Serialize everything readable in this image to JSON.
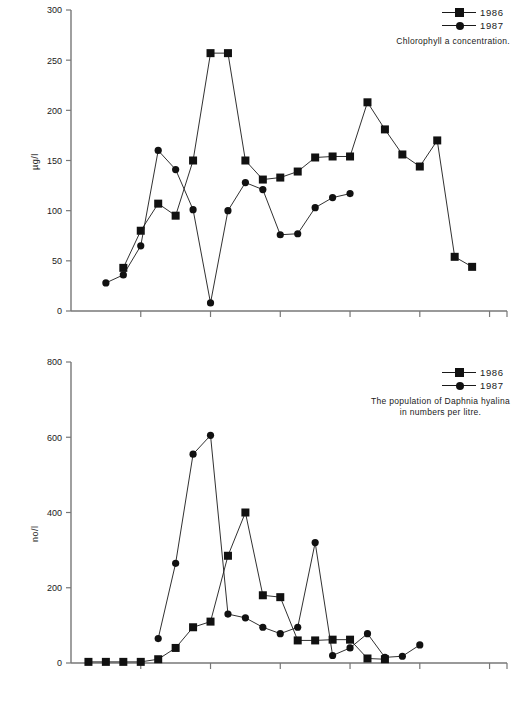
{
  "figure": {
    "background": "#ffffff",
    "ink": "#1a1a1a"
  },
  "charts": [
    {
      "id": "chlorophyll",
      "legend": {
        "entries": [
          {
            "label": "1986",
            "marker": "square-marker",
            "color": "#111111"
          },
          {
            "label": "1987",
            "marker": "circle-marker",
            "color": "#111111"
          }
        ],
        "caption": "Chlorophyll a concentration."
      },
      "ylabel": "µg/l",
      "yticks": [
        "0",
        "50",
        "100",
        "150",
        "200",
        "250",
        "300"
      ]
    },
    {
      "id": "daphnia",
      "legend": {
        "entries": [
          {
            "label": "1986",
            "marker": "square-marker",
            "color": "#111111"
          },
          {
            "label": "1987",
            "marker": "circle-marker",
            "color": "#111111"
          }
        ],
        "caption": "The population of Daphnia hyalina\nin numbers per litre."
      },
      "ylabel": "no/l",
      "yticks": [
        "0",
        "200",
        "400",
        "600",
        "800"
      ]
    }
  ],
  "chart_data": [
    {
      "type": "line",
      "id": "chlorophyll",
      "title": "Chlorophyll a concentration.",
      "xlabel": "",
      "ylabel": "µg/l",
      "ylim": [
        0,
        300
      ],
      "yticks": [
        0,
        50,
        100,
        150,
        200,
        250,
        300
      ],
      "xlim": [
        0,
        25
      ],
      "xticks": [
        0,
        4,
        8,
        12,
        16,
        20,
        24
      ],
      "xtick_labels": [
        "",
        "",
        "",
        "",
        "",
        "",
        ""
      ],
      "grid": false,
      "legend_position": "top-right",
      "series": [
        {
          "name": "1986",
          "marker": "square",
          "x": [
            3,
            4,
            5,
            6,
            7,
            8,
            9,
            10,
            11,
            12,
            13,
            14,
            15,
            16,
            17,
            18,
            19,
            20,
            21,
            22,
            23
          ],
          "values": [
            43,
            80,
            107,
            95,
            150,
            257,
            257,
            150,
            131,
            133,
            139,
            153,
            154,
            154,
            208,
            181,
            156,
            144,
            170,
            54,
            44
          ]
        },
        {
          "name": "1987",
          "marker": "circle",
          "x": [
            2,
            3,
            4,
            5,
            6,
            7,
            8,
            9,
            10,
            11,
            12,
            13,
            14,
            15,
            16
          ],
          "values": [
            28,
            36,
            65,
            160,
            141,
            101,
            8,
            100,
            128,
            121,
            76,
            77,
            103,
            113,
            117
          ]
        }
      ]
    },
    {
      "type": "line",
      "id": "daphnia",
      "title": "The population of Daphnia hyalina in numbers per litre.",
      "xlabel": "",
      "ylabel": "no/l",
      "ylim": [
        0,
        800
      ],
      "yticks": [
        0,
        200,
        400,
        600,
        800
      ],
      "xlim": [
        0,
        25
      ],
      "xticks": [
        0,
        4,
        8,
        12,
        16,
        20,
        24
      ],
      "xtick_labels": [
        "",
        "",
        "",
        "",
        "",
        "",
        ""
      ],
      "grid": false,
      "legend_position": "top-right",
      "series": [
        {
          "name": "1986",
          "marker": "square",
          "x": [
            1,
            2,
            3,
            4,
            5,
            6,
            7,
            8,
            9,
            10,
            11,
            12,
            13,
            14,
            15,
            16,
            17,
            18
          ],
          "values": [
            3,
            3,
            3,
            3,
            10,
            40,
            95,
            110,
            285,
            400,
            180,
            175,
            60,
            60,
            62,
            62,
            12,
            10
          ]
        },
        {
          "name": "1987",
          "marker": "circle",
          "x": [
            5,
            6,
            7,
            8,
            9,
            10,
            11,
            12,
            13,
            14,
            15,
            16,
            17,
            18,
            19,
            20
          ],
          "values": [
            65,
            265,
            555,
            605,
            130,
            120,
            95,
            78,
            95,
            320,
            20,
            40,
            78,
            15,
            18,
            48
          ]
        }
      ]
    }
  ]
}
